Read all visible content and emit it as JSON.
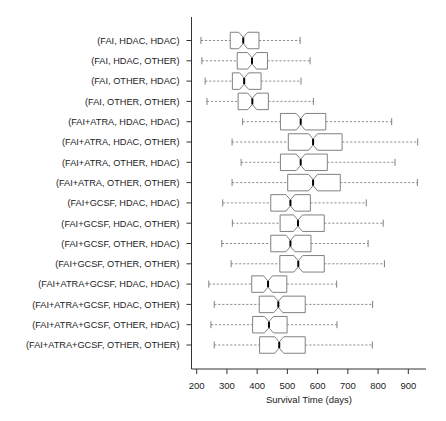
{
  "chart_data": {
    "type": "boxplot",
    "orientation": "horizontal",
    "notched": true,
    "title": "",
    "xlabel": "Survival Time (days)",
    "ylabel": "",
    "xlim": [
      180,
      960
    ],
    "xticks": [
      200,
      300,
      400,
      500,
      600,
      700,
      800,
      900
    ],
    "xtick_labels": [
      "200",
      "300",
      "400",
      "500",
      "600",
      "700",
      "800",
      "900"
    ],
    "grid": false,
    "legend": null,
    "colors": {
      "box_stroke": "#808080",
      "median": "#000000",
      "whisker": "#808080",
      "axis": "#333333"
    },
    "categories": [
      "(FAI, HDAC, HDAC)",
      "(FAI, HDAC, OTHER)",
      "(FAI, OTHER, HDAC)",
      "(FAI, OTHER, OTHER)",
      "(FAI+ATRA, HDAC, HDAC)",
      "(FAI+ATRA, HDAC, OTHER)",
      "(FAI+ATRA, OTHER, HDAC)",
      "(FAI+ATRA, OTHER, OTHER)",
      "(FAI+GCSF, HDAC, HDAC)",
      "(FAI+GCSF, HDAC, OTHER)",
      "(FAI+GCSF, OTHER, HDAC)",
      "(FAI+GCSF, OTHER, OTHER)",
      "(FAI+ATRA+GCSF, HDAC, HDAC)",
      "(FAI+ATRA+GCSF, HDAC, OTHER)",
      "(FAI+ATRA+GCSF, OTHER, HDAC)",
      "(FAI+ATRA+GCSF, OTHER, OTHER)"
    ],
    "boxes": [
      {
        "whisker_low": 214,
        "q1": 311,
        "median": 354,
        "q3": 406,
        "whisker_high": 542
      },
      {
        "whisker_low": 217,
        "q1": 334,
        "median": 383,
        "q3": 434,
        "whisker_high": 575
      },
      {
        "whisker_low": 228,
        "q1": 318,
        "median": 357,
        "q3": 413,
        "whisker_high": 545
      },
      {
        "whisker_low": 234,
        "q1": 337,
        "median": 384,
        "q3": 437,
        "whisker_high": 586
      },
      {
        "whisker_low": 352,
        "q1": 477,
        "median": 544,
        "q3": 627,
        "whisker_high": 845
      },
      {
        "whisker_low": 317,
        "q1": 503,
        "median": 585,
        "q3": 681,
        "whisker_high": 931
      },
      {
        "whisker_low": 347,
        "q1": 477,
        "median": 544,
        "q3": 632,
        "whisker_high": 856
      },
      {
        "whisker_low": 317,
        "q1": 501,
        "median": 585,
        "q3": 675,
        "whisker_high": 930
      },
      {
        "whisker_low": 286,
        "q1": 445,
        "median": 510,
        "q3": 576,
        "whisker_high": 761
      },
      {
        "whisker_low": 318,
        "q1": 476,
        "median": 535,
        "q3": 622,
        "whisker_high": 817
      },
      {
        "whisker_low": 283,
        "q1": 445,
        "median": 510,
        "q3": 578,
        "whisker_high": 767
      },
      {
        "whisker_low": 314,
        "q1": 475,
        "median": 536,
        "q3": 622,
        "whisker_high": 821
      },
      {
        "whisker_low": 240,
        "q1": 382,
        "median": 436,
        "q3": 498,
        "whisker_high": 663
      },
      {
        "whisker_low": 258,
        "q1": 407,
        "median": 470,
        "q3": 559,
        "whisker_high": 782
      },
      {
        "whisker_low": 247,
        "q1": 385,
        "median": 439,
        "q3": 499,
        "whisker_high": 664
      },
      {
        "whisker_low": 258,
        "q1": 408,
        "median": 473,
        "q3": 559,
        "whisker_high": 781
      }
    ]
  }
}
